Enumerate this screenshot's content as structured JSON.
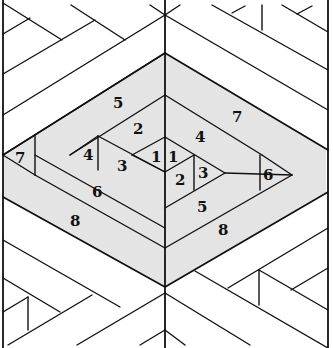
{
  "diagram": {
    "colors": {
      "shade": "#e4e4e4",
      "line": "#111111",
      "background": "#ffffff"
    },
    "labels": [
      {
        "id": "l5a",
        "text": "5",
        "x": 120,
        "y": 108
      },
      {
        "id": "l7a",
        "text": "7",
        "x": 238,
        "y": 122
      },
      {
        "id": "l2a",
        "text": "2",
        "x": 140,
        "y": 134
      },
      {
        "id": "l4a",
        "text": "4",
        "x": 200,
        "y": 142
      },
      {
        "id": "l7b",
        "text": "7",
        "x": 22,
        "y": 163
      },
      {
        "id": "l4b",
        "text": "4",
        "x": 88,
        "y": 160
      },
      {
        "id": "l3a",
        "text": "3",
        "x": 122,
        "y": 170
      },
      {
        "id": "l1a",
        "text": "1",
        "x": 156,
        "y": 161
      },
      {
        "id": "l1b",
        "text": "1",
        "x": 172,
        "y": 161
      },
      {
        "id": "l2b",
        "text": "2",
        "x": 180,
        "y": 184
      },
      {
        "id": "l3b",
        "text": "3",
        "x": 203,
        "y": 177
      },
      {
        "id": "l6a",
        "text": "6",
        "x": 268,
        "y": 179
      },
      {
        "id": "l6b",
        "text": "6",
        "x": 97,
        "y": 196
      },
      {
        "id": "l5b",
        "text": "5",
        "x": 202,
        "y": 211
      },
      {
        "id": "l8a",
        "text": "8",
        "x": 75,
        "y": 225
      },
      {
        "id": "l8b",
        "text": "8",
        "x": 223,
        "y": 234
      }
    ]
  }
}
